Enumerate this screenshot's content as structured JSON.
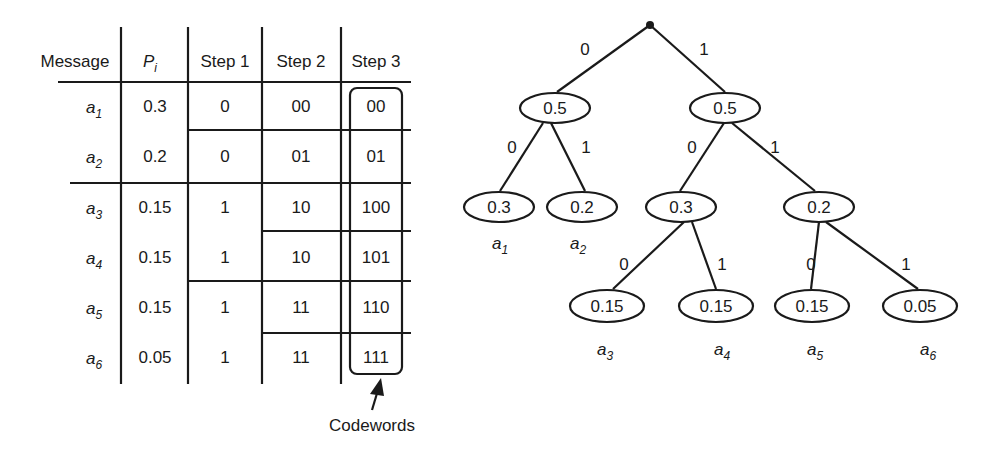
{
  "table": {
    "headers": [
      "Message",
      "P_i",
      "Step 1",
      "Step 2",
      "Step 3"
    ],
    "header_pi": {
      "base": "P",
      "sub": "i"
    },
    "rows": [
      {
        "msg": "a",
        "sub": "1",
        "p": "0.3",
        "s1": "0",
        "s2": "00",
        "s3": "00"
      },
      {
        "msg": "a",
        "sub": "2",
        "p": "0.2",
        "s1": "0",
        "s2": "01",
        "s3": "01"
      },
      {
        "msg": "a",
        "sub": "3",
        "p": "0.15",
        "s1": "1",
        "s2": "10",
        "s3": "100"
      },
      {
        "msg": "a",
        "sub": "4",
        "p": "0.15",
        "s1": "1",
        "s2": "10",
        "s3": "101"
      },
      {
        "msg": "a",
        "sub": "5",
        "p": "0.15",
        "s1": "1",
        "s2": "11",
        "s3": "110"
      },
      {
        "msg": "a",
        "sub": "6",
        "p": "0.05",
        "s1": "1",
        "s2": "11",
        "s3": "111"
      }
    ],
    "annotation": "Codewords"
  },
  "tree": {
    "root_edges": {
      "left": "0",
      "right": "1"
    },
    "level1": [
      {
        "value": "0.5",
        "edge_left": "0",
        "edge_right": "1"
      },
      {
        "value": "0.5",
        "edge_left": "0",
        "edge_right": "1"
      }
    ],
    "level2": [
      {
        "value": "0.3",
        "label": "a",
        "sub": "1"
      },
      {
        "value": "0.2",
        "label": "a",
        "sub": "2"
      },
      {
        "value": "0.3",
        "edge_left": "0",
        "edge_right": "1"
      },
      {
        "value": "0.2",
        "edge_left": "0",
        "edge_right": "1"
      }
    ],
    "level3": [
      {
        "value": "0.15",
        "label": "a",
        "sub": "3"
      },
      {
        "value": "0.15",
        "label": "a",
        "sub": "4"
      },
      {
        "value": "0.15",
        "label": "a",
        "sub": "5"
      },
      {
        "value": "0.05",
        "label": "a",
        "sub": "6"
      }
    ]
  }
}
